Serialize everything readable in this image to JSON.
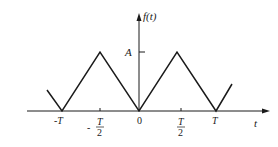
{
  "diagram": {
    "type": "periodic-triangle-wave",
    "colors": {
      "stroke": "#1a1a1a",
      "background": "#ffffff"
    },
    "y_axis": {
      "label": "f(t)"
    },
    "x_axis": {
      "label": "t"
    },
    "amplitude_label": "A",
    "ticks": [
      {
        "label": "-T",
        "position": "-T"
      },
      {
        "label_num": "T",
        "label_den": "2",
        "sign": "-",
        "position": "-T/2"
      },
      {
        "label": "0",
        "position": "0"
      },
      {
        "label_num": "T",
        "label_den": "2",
        "sign": "",
        "position": "T/2"
      },
      {
        "label": "T",
        "position": "T"
      }
    ],
    "waveform_points": [
      {
        "t": "-1.25T",
        "value": "0.5A"
      },
      {
        "t": "-T",
        "value": "0"
      },
      {
        "t": "-T/2",
        "value": "A"
      },
      {
        "t": "0",
        "value": "0"
      },
      {
        "t": "T/2",
        "value": "A"
      },
      {
        "t": "T",
        "value": "0"
      },
      {
        "t": "1.25T",
        "value": "0.5A"
      }
    ]
  }
}
